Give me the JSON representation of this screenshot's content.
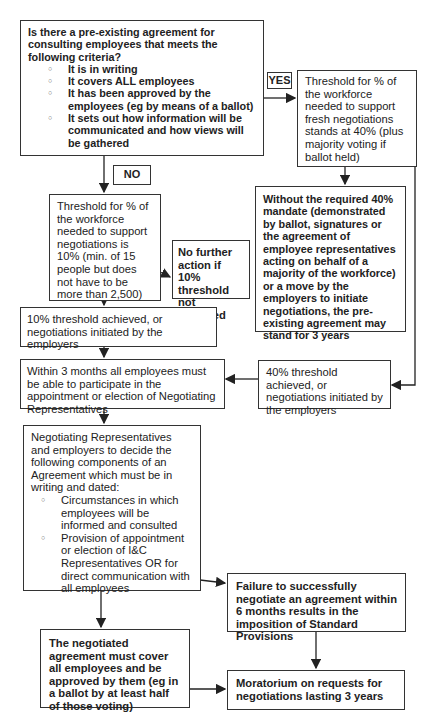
{
  "diagram": {
    "question_box": {
      "text": "Is there a pre-existing agreement for consulting employees that meets the following criteria?",
      "criteria": [
        "It is in writing",
        "It covers ALL employees",
        "It has been approved by the employees (eg by means of a ballot)",
        "It sets out how information will be communicated and how views will be gathered"
      ]
    },
    "yes_label": "YES",
    "no_label": "NO",
    "threshold_40_box": "Threshold for % of the workforce needed to support fresh negotiations stands at 40% (plus majority voting if ballot held)",
    "without_40_box": "Without the required 40% mandate (demonstrated by ballot, signatures or the agreement of employee representatives acting on behalf of a majority of the workforce) or a move by the employers to initiate negotiations, the pre-existing agreement may stand for 3 years",
    "threshold_10_box": "Threshold for % of the workforce needed to support negotiations is 10% (min. of 15 people but does not have to be more than 2,500)",
    "no_further_action_box": "No further action if 10% threshold not achieved",
    "achieved_10_box": "10% threshold achieved, or negotiations initiated by the employers",
    "achieved_40_box": "40% threshold achieved, or negotiations initiated by the employers",
    "within_3_months_box": "Within 3 months all employees must be able to participate in the appointment or election of Negotiating Representatives",
    "negotiating_reps_box": {
      "text": "Negotiating Representatives and employers to decide the following components of an Agreement which must be in writing and dated:",
      "components": [
        "Circumstances in which employees will be informed and consulted",
        "Provision of appointment or election of  I&C Representatives OR for direct communication with all employees"
      ]
    },
    "failure_box": "Failure to successfully negotiate an agreement within 6 months results in the imposition of Standard Provisions",
    "negotiated_agreement_box": "The negotiated agreement must cover all employees and be approved by them (eg in a ballot by at least half of those voting)",
    "moratorium_box": "Moratorium on requests for negotiations lasting 3 years"
  }
}
